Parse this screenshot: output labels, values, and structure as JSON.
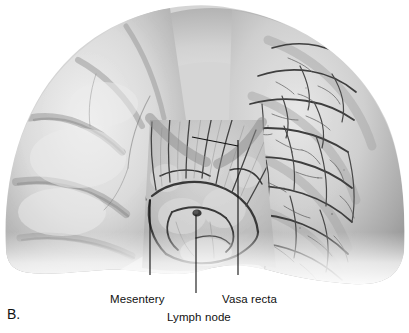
{
  "figure": {
    "panel_letter": "B.",
    "background_color": "#ffffff",
    "ink_color": "#111111"
  },
  "labels": [
    {
      "id": "mesentery",
      "text": "Mesentery",
      "leader": {
        "x1": 150,
        "y1": 275,
        "x2": 150,
        "y2": 200
      }
    },
    {
      "id": "lymph-node",
      "text": "Lymph node",
      "leader": {
        "x1": 196,
        "y1": 293,
        "x2": 196,
        "y2": 215
      }
    },
    {
      "id": "vasa-recta",
      "text": "Vasa recta",
      "leader": {
        "x1": 238,
        "y1": 275,
        "x2": 238,
        "y2": 140
      },
      "branch": {
        "x1": 238,
        "y1": 146,
        "x2": 192,
        "y2": 137
      }
    }
  ],
  "anatomy": {
    "bowel_loop": "horseshoe-shaped loop of small intestine, arch open inferiorly",
    "left_segment": "smooth pale antimesenteric bowel wall, few surface vessels",
    "right_segment": "dense branching vasa recta over serosal surface",
    "center": "mesenteric fan with vascular arcades and a lymph node",
    "tones": {
      "highlight": "#f4f4f4",
      "midtone": "#bdbdbd",
      "shadow": "#8a8a8a",
      "vessel": "#4a4a4a"
    }
  }
}
